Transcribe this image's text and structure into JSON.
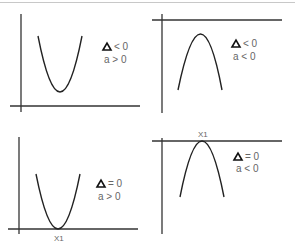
{
  "panels": [
    {
      "id": "top-left",
      "curve": "upward-parabola",
      "delta_symbol": "Δ",
      "delta_condition": "< 0",
      "a_condition": "a > 0",
      "root_label": null
    },
    {
      "id": "top-right",
      "curve": "downward-parabola",
      "delta_symbol": "Δ",
      "delta_condition": "< 0",
      "a_condition": "a < 0",
      "root_label": null
    },
    {
      "id": "bottom-left",
      "curve": "upward-parabola-tangent",
      "delta_symbol": "Δ",
      "delta_condition": "= 0",
      "a_condition": "a > 0",
      "root_label": "X1"
    },
    {
      "id": "bottom-right",
      "curve": "downward-parabola-tangent",
      "delta_symbol": "Δ",
      "delta_condition": "= 0",
      "a_condition": "a < 0",
      "root_label": "X1"
    }
  ],
  "colors": {
    "axis": "#333333",
    "curve": "#222222",
    "text": "#666666"
  }
}
